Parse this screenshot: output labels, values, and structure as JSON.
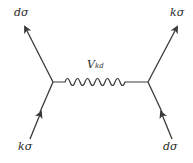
{
  "diagram": {
    "type": "feynman",
    "labels": {
      "top_left": "dσ",
      "top_right": "kσ",
      "bottom_left": "kσ",
      "bottom_right": "dσ",
      "interaction_main": "V",
      "interaction_sub": "kd"
    },
    "colors": {
      "line": "#3a3a3a",
      "text": "#2a2a2a"
    }
  }
}
